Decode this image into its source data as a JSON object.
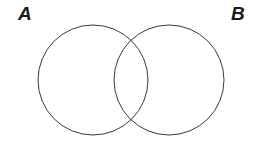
{
  "figure": {
    "type": "venn-diagram",
    "width": 262,
    "height": 142,
    "background_color": "#ffffff",
    "stroke_color": "#3a3a3a",
    "stroke_width": 1,
    "fill": "none"
  },
  "labels": {
    "left_set": "A",
    "right_set": "B"
  },
  "sets": [
    {
      "name": "A",
      "label": "A",
      "circle": {
        "cx": 93,
        "cy": 80,
        "r": 55
      },
      "label_position": {
        "x": 18,
        "y": 4
      }
    },
    {
      "name": "B",
      "label": "B",
      "circle": {
        "cx": 169,
        "cy": 80,
        "r": 55
      },
      "label_position": {
        "x": 231,
        "y": 4
      }
    }
  ],
  "intersection": {
    "upper_point": {
      "x": 131,
      "y": 42
    },
    "lower_point": {
      "x": 131,
      "y": 118
    },
    "shaded": false
  }
}
